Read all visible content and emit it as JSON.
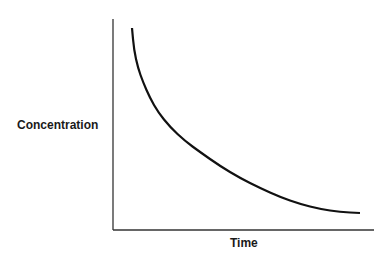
{
  "chart_data": {
    "type": "line",
    "title": "",
    "xlabel": "Time",
    "ylabel": "Concentration",
    "grid": false,
    "legend": null,
    "ticks": "none",
    "series": [
      {
        "name": "concentration-decay",
        "description": "Exponential-like decay curve, no numeric ticks shown",
        "points_px": [
          [
            132,
            28
          ],
          [
            134,
            50
          ],
          [
            138,
            68
          ],
          [
            143,
            82
          ],
          [
            150,
            98
          ],
          [
            158,
            112
          ],
          [
            170,
            127
          ],
          [
            185,
            141
          ],
          [
            200,
            152
          ],
          [
            220,
            166
          ],
          [
            240,
            178
          ],
          [
            260,
            188
          ],
          [
            280,
            197
          ],
          [
            300,
            204
          ],
          [
            320,
            209
          ],
          [
            340,
            212
          ],
          [
            360,
            213
          ]
        ]
      }
    ],
    "colors": {
      "line": "#111111",
      "axis": "#333333",
      "text": "#1a1a1a"
    }
  }
}
